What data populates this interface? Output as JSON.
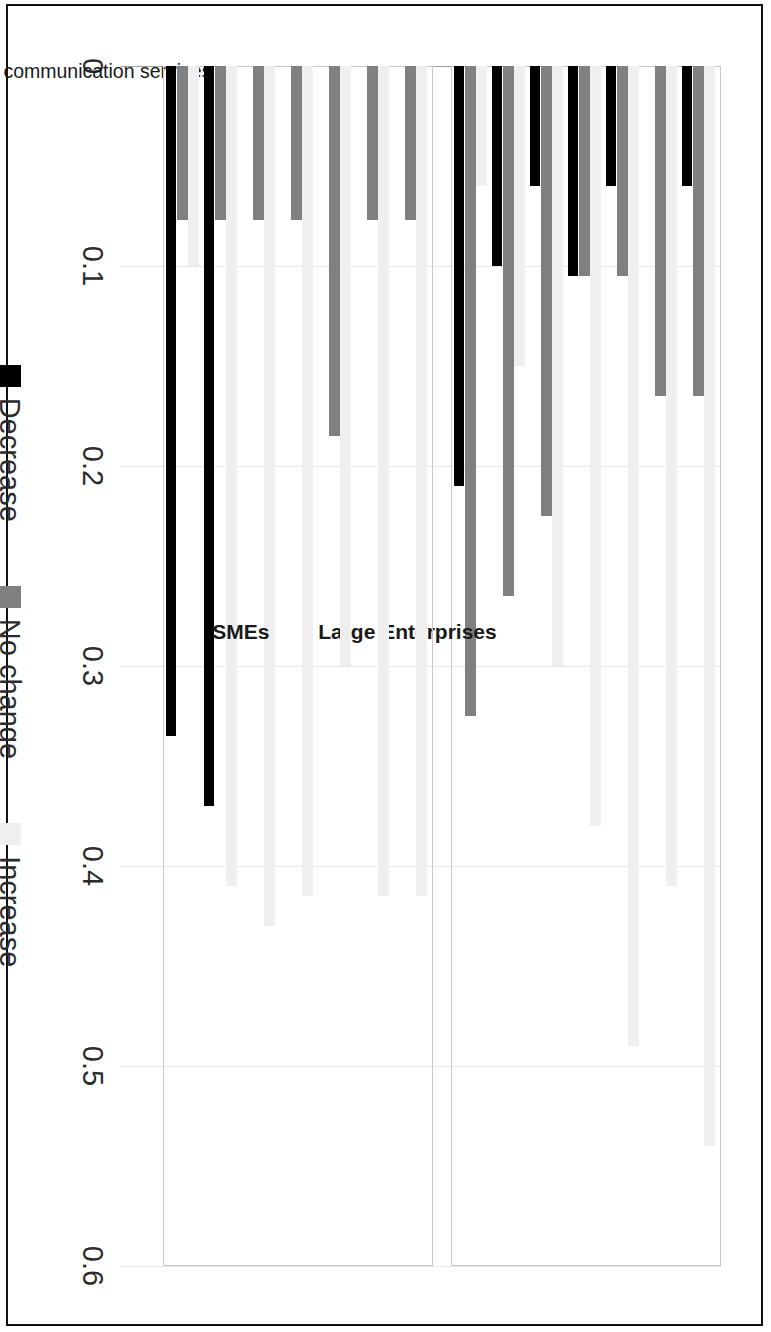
{
  "figure": {
    "orientation": "rotated-90-ccw",
    "axis_ticks": [
      "0",
      "0.1",
      "0.2",
      "0.3",
      "0.4",
      "0.5",
      "0.6"
    ]
  },
  "legend": {
    "items": [
      {
        "label": "Decrease",
        "color": "#000000"
      },
      {
        "label": "No change",
        "color": "#808080"
      },
      {
        "label": "Increase",
        "color": "#efefef"
      }
    ]
  },
  "groups": [
    {
      "name": "Large Enterprises"
    },
    {
      "name": "SMEs"
    }
  ],
  "chart_data": {
    "type": "bar",
    "title": "",
    "subtitle": "",
    "xlabel": "",
    "ylabel": "",
    "orientation": "horizontal",
    "xlim": [
      0,
      0.6
    ],
    "xticks": [
      0,
      0.1,
      0.2,
      0.3,
      0.4,
      0.5,
      0.6
    ],
    "grid": true,
    "legend_position": "bottom",
    "legend_entries": [
      "Decrease",
      "No change",
      "Increase"
    ],
    "group_labels": [
      "Large Enterprises",
      "SMEs"
    ],
    "categories": [
      "Connectivity in terms of transport and communication services",
      "Investment  Process in ASEAN Countries",
      "Recognition of Professional Qualifications",
      "Standard Regulation",
      "Customs Procedure",
      "Export Tariffs/Duties",
      "Import Tariffs/Duties"
    ],
    "panels": [
      {
        "group": "Large Enterprises",
        "series": [
          {
            "name": "Decrease",
            "color": "#000000",
            "values": [
              0.06,
              0.0,
              0.06,
              0.105,
              0.06,
              0.1,
              0.21
            ]
          },
          {
            "name": "No change",
            "color": "#808080",
            "values": [
              0.165,
              0.165,
              0.105,
              0.105,
              0.225,
              0.265,
              0.325
            ]
          },
          {
            "name": "Increase",
            "color": "#efefef",
            "values": [
              0.54,
              0.41,
              0.49,
              0.38,
              0.3,
              0.15,
              0.06
            ]
          }
        ]
      },
      {
        "group": "SMEs",
        "series": [
          {
            "name": "Decrease",
            "color": "#000000",
            "values": [
              0.0,
              0.0,
              0.0,
              0.0,
              0.0,
              0.37,
              0.335
            ]
          },
          {
            "name": "No change",
            "color": "#808080",
            "values": [
              0.077,
              0.077,
              0.185,
              0.077,
              0.077,
              0.077,
              0.077
            ]
          },
          {
            "name": "Increase",
            "color": "#efefef",
            "values": [
              0.415,
              0.415,
              0.3,
              0.415,
              0.43,
              0.41,
              0.1
            ]
          }
        ]
      }
    ]
  }
}
